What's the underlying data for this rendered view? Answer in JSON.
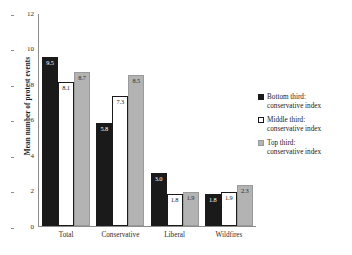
{
  "chart_data": {
    "type": "bar",
    "title": "",
    "subtitle": "",
    "xlabel": "",
    "ylabel": "Mean number of protest events",
    "ylim": [
      0,
      12
    ],
    "yticks": [
      0,
      2,
      4,
      6,
      8,
      10,
      12
    ],
    "ytick_labels": [
      "0",
      "2",
      "4",
      "6",
      "8",
      "10",
      "12"
    ],
    "grid": false,
    "legend_position": "right",
    "categories": [
      "Total",
      "Conservative",
      "Liberal",
      "Wildfires"
    ],
    "series": [
      {
        "name": "Bottom third: conservative index",
        "legend_line1": "Bottom third:",
        "legend_line2": "conservative index",
        "color": "#1a1a1a",
        "values": [
          9.5,
          5.8,
          3.0,
          1.8
        ],
        "labels": [
          "9.5",
          "5.8",
          "3.0",
          "1.8"
        ]
      },
      {
        "name": "Middle third: conservative index",
        "legend_line1": "Middle third:",
        "legend_line2": "conservative index",
        "color": "#ffffff",
        "values": [
          8.1,
          7.3,
          1.8,
          1.9
        ],
        "labels": [
          "8.1",
          "7.3",
          "1.8",
          "1.9"
        ]
      },
      {
        "name": "Top third: conservative index",
        "legend_line1": "Top third:",
        "legend_line2": "conservative index",
        "color": "#b3b3b3",
        "values": [
          8.7,
          8.5,
          1.9,
          2.3
        ],
        "labels": [
          "8.7",
          "8.5",
          "1.9",
          "2.3"
        ]
      }
    ]
  }
}
